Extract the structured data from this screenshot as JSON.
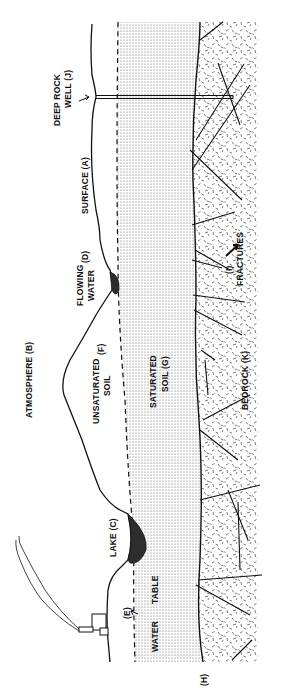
{
  "figure": {
    "type": "hydrogeologic cross-section",
    "orientation": "rotated 90 degrees counter-clockwise",
    "colors": {
      "ink": "#111111",
      "background": "#ffffff",
      "water": "#1a1a1a",
      "stipple": "#555555"
    }
  },
  "labels": {
    "atmosphere": "ATMOSPHERE (B)",
    "surface": "SURFACE (A)",
    "deep_rock_well_line1": "DEEP ROCK",
    "deep_rock_well_line2": "WELL (J)",
    "flowing_water_line1": "FLOWING",
    "flowing_water_line2": "WATER",
    "flowing_water_letter": "(D)",
    "unsaturated_line1": "UNSATURATED",
    "unsaturated_line2": "SOIL",
    "unsaturated_letter": "(F)",
    "saturated_line1": "SATURATED",
    "saturated_line2": "SOIL (G)",
    "fractures_letter": "(I)",
    "fractures": "FRACTURES",
    "bedrock": "BEDROCK (K)",
    "lake": "LAKE (C)",
    "water_table_letter": "(E)",
    "water_table_line1": "WATER",
    "water_table_line2": "TABLE",
    "interface": "(H)"
  }
}
